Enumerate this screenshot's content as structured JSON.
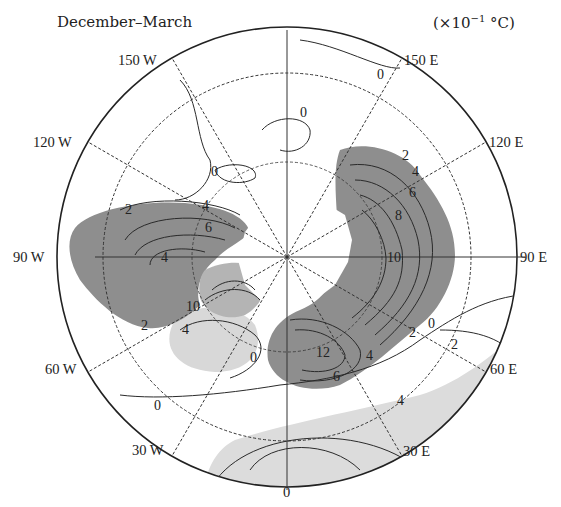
{
  "title": "December–March",
  "units": {
    "prefix": "(×10",
    "exp": "−1",
    "suffix": " °C)"
  },
  "map": {
    "projection": "north polar stereographic",
    "center": {
      "x": 287,
      "y": 257
    },
    "radius": 230,
    "dashed_circle_radius": 184,
    "longitude_labels": [
      {
        "id": "lon-0",
        "text": "0"
      },
      {
        "id": "lon-30e",
        "text": "30 E"
      },
      {
        "id": "lon-60e",
        "text": "60 E"
      },
      {
        "id": "lon-90e",
        "text": "90 E"
      },
      {
        "id": "lon-120e",
        "text": "120 E"
      },
      {
        "id": "lon-150e",
        "text": "150 E"
      },
      {
        "id": "lon-150w",
        "text": "150 W"
      },
      {
        "id": "lon-120w",
        "text": "120 W"
      },
      {
        "id": "lon-90w",
        "text": "90 W"
      },
      {
        "id": "lon-60w",
        "text": "60 W"
      },
      {
        "id": "lon-30w",
        "text": "30 W"
      }
    ],
    "contour_labels": [
      {
        "id": "c-0-top-right",
        "text": "0"
      },
      {
        "id": "c-0-north",
        "text": "0"
      },
      {
        "id": "c-0-pacific",
        "text": "0"
      },
      {
        "id": "c-2-canada",
        "text": "2"
      },
      {
        "id": "c-4-canada",
        "text": "4"
      },
      {
        "id": "c-6-canada",
        "text": "6"
      },
      {
        "id": "c-4-hudson",
        "text": "4"
      },
      {
        "id": "c-10-greenland",
        "text": "10"
      },
      {
        "id": "c-2-labrador",
        "text": "2"
      },
      {
        "id": "c-4-labrador",
        "text": "4"
      },
      {
        "id": "c-0-atlantic",
        "text": "0"
      },
      {
        "id": "c-0-southwest",
        "text": "0"
      },
      {
        "id": "c-2-siberia",
        "text": "2"
      },
      {
        "id": "c-4-siberia",
        "text": "4"
      },
      {
        "id": "c-6-siberia",
        "text": "6"
      },
      {
        "id": "c-8-siberia",
        "text": "8"
      },
      {
        "id": "c-10-siberia",
        "text": "10"
      },
      {
        "id": "c-12-europe",
        "text": "12"
      },
      {
        "id": "c-4-europe",
        "text": "4"
      },
      {
        "id": "c-6-europe",
        "text": "6"
      },
      {
        "id": "c-2-east",
        "text": "2"
      },
      {
        "id": "c-0-east",
        "text": "0"
      },
      {
        "id": "c-2-asia",
        "text": "2"
      },
      {
        "id": "c-4-africa",
        "text": "4"
      }
    ],
    "colors": {
      "positive_shading": "#8e8e8e",
      "light_shading": "#d6d6d6",
      "line": "#2a2a2a",
      "background": "#ffffff"
    }
  }
}
